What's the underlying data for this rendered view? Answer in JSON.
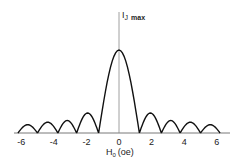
{
  "chart_data": {
    "type": "line",
    "title": "",
    "xlabel": "H0 (oe)",
    "xlabel_main": "H",
    "xlabel_sub": "0",
    "xlabel_unit": "(oe)",
    "ylabel": "IJ max",
    "ylabel_main": "I",
    "ylabel_sub": "J",
    "ylabel_suffix": "max",
    "xlim": [
      -6.5,
      6.8
    ],
    "ylim": [
      0,
      1.2
    ],
    "grid": false,
    "x_ticks": [
      -6,
      -4,
      -2,
      0,
      2,
      4,
      6
    ],
    "x_tick_labels": [
      "-6",
      "-4",
      "-2",
      "0",
      "2",
      "4",
      "6"
    ],
    "zeros": [
      -6.2,
      -5.0,
      -3.75,
      -2.6,
      -1.25,
      1.25,
      2.6,
      3.75,
      5.0,
      6.2
    ],
    "lobes": [
      {
        "x_from": -6.2,
        "x_to": -5.0,
        "peak_x": -5.6,
        "peak_y": 0.1
      },
      {
        "x_from": -5.0,
        "x_to": -3.75,
        "peak_x": -4.4,
        "peak_y": 0.13
      },
      {
        "x_from": -3.75,
        "x_to": -2.6,
        "peak_x": -3.2,
        "peak_y": 0.15
      },
      {
        "x_from": -2.6,
        "x_to": -1.25,
        "peak_x": -1.95,
        "peak_y": 0.24
      },
      {
        "x_from": -1.25,
        "x_to": 1.25,
        "peak_x": 0,
        "peak_y": 1.0
      },
      {
        "x_from": 1.25,
        "x_to": 2.6,
        "peak_x": 1.95,
        "peak_y": 0.24
      },
      {
        "x_from": 2.6,
        "x_to": 3.75,
        "peak_x": 3.2,
        "peak_y": 0.15
      },
      {
        "x_from": 3.75,
        "x_to": 5.0,
        "peak_x": 4.4,
        "peak_y": 0.13
      },
      {
        "x_from": 5.0,
        "x_to": 6.2,
        "peak_x": 5.6,
        "peak_y": 0.1
      }
    ]
  }
}
